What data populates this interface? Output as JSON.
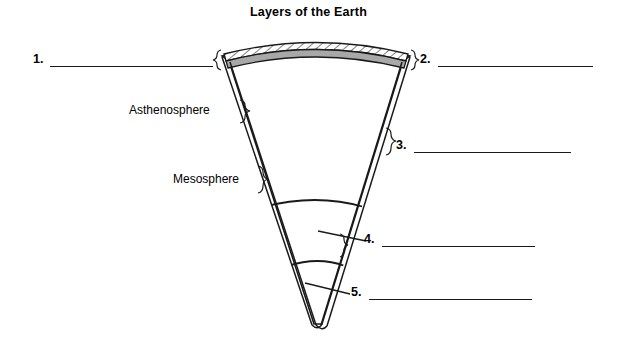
{
  "title": "Layers of the Earth",
  "diagram": {
    "kind": "earth-layers-cross-section-worksheet",
    "interior_fill": "#ffffff",
    "outline_color": "#1a1a1a",
    "crust_band_pattern": "diagonal-hatch",
    "crust_band_fill": "#ffffff",
    "second_band_fill": "#a8a8a8"
  },
  "named_labels": [
    {
      "id": "asthenosphere",
      "text": "Asthenosphere",
      "side": "left"
    },
    {
      "id": "mesosphere",
      "text": "Mesosphere",
      "side": "left"
    }
  ],
  "blank_labels": [
    {
      "id": "blank-1",
      "number": "1.",
      "side": "left"
    },
    {
      "id": "blank-2",
      "number": "2.",
      "side": "right"
    },
    {
      "id": "blank-3",
      "number": "3.",
      "side": "right"
    },
    {
      "id": "blank-4",
      "number": "4.",
      "side": "right"
    },
    {
      "id": "blank-5",
      "number": "5.",
      "side": "right"
    }
  ]
}
